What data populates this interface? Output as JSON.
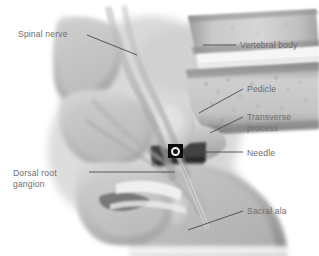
{
  "figure": {
    "name": "lumbosacral-spine-fluoroscopy-illustration",
    "width": 319,
    "height": 256,
    "background_color": "#ffffff"
  },
  "style": {
    "label_color": "#6e6e70",
    "leader_color": "#4a4a4c",
    "marker_fill": "#0a0a0a",
    "marker_ring": "#f2f2f2",
    "bone_light": "#d9d9d9",
    "bone_mid": "#b4b4b4",
    "bone_dark": "#8a8a8a",
    "bone_shadow": "#5c5c5c"
  },
  "labels": [
    {
      "id": "spinal-nerve",
      "text": "Spinal nerve",
      "side": "left",
      "x": 18,
      "y": 29,
      "leader": {
        "x1": 87,
        "y1": 35,
        "x2": 137,
        "y2": 55
      }
    },
    {
      "id": "dorsal-root-ganglion",
      "text": "Dorsal root\ngangion",
      "side": "left",
      "x": 13,
      "y": 168,
      "leader": {
        "x1": 89,
        "y1": 172,
        "x2": 175,
        "y2": 172
      }
    },
    {
      "id": "vertebral-body",
      "text": "Vertebral body",
      "side": "right",
      "x": 240,
      "y": 40,
      "leader": {
        "x1": 203,
        "y1": 45,
        "x2": 236,
        "y2": 45
      }
    },
    {
      "id": "pedicle",
      "text": "Pedicle",
      "side": "right",
      "x": 247,
      "y": 84,
      "leader": {
        "x1": 199,
        "y1": 113,
        "x2": 243,
        "y2": 89
      }
    },
    {
      "id": "transverse-process",
      "text": "Transverse\nprocess",
      "side": "right",
      "x": 247,
      "y": 112,
      "leader": {
        "x1": 210,
        "y1": 133,
        "x2": 243,
        "y2": 117
      }
    },
    {
      "id": "needle",
      "text": "Needle",
      "side": "right",
      "x": 247,
      "y": 148,
      "leader": {
        "x1": 193,
        "y1": 152,
        "x2": 243,
        "y2": 152
      }
    },
    {
      "id": "sacral-ala",
      "text": "Sacral ala",
      "side": "right",
      "x": 247,
      "y": 206,
      "leader": {
        "x1": 188,
        "y1": 230,
        "x2": 243,
        "y2": 211
      }
    }
  ],
  "markers": [
    {
      "id": "needle-marker",
      "shape": "square-with-ring",
      "x": 168,
      "y": 144,
      "width": 15,
      "height": 14,
      "ring_diameter": 9,
      "ring_thickness": 2
    }
  ],
  "anatomy_regions": [
    {
      "id": "upper-vertebral-body",
      "label": "Vertebral body"
    },
    {
      "id": "lower-vertebral-body",
      "label": "Vertebral body"
    },
    {
      "id": "pedicle-ellipse",
      "label": "Pedicle"
    },
    {
      "id": "transverse-process-wing",
      "label": "Transverse process"
    },
    {
      "id": "spinal-nerve-root",
      "label": "Spinal nerve"
    },
    {
      "id": "dorsal-root-ganglion-body",
      "label": "Dorsal root ganglion"
    },
    {
      "id": "sacral-ala-mass",
      "label": "Sacral ala"
    },
    {
      "id": "disc-space-band",
      "label": "Intervertebral disc space"
    },
    {
      "id": "superior-articular-process",
      "label": "Superior articular process"
    },
    {
      "id": "spinous-process",
      "label": "Spinous process"
    }
  ]
}
